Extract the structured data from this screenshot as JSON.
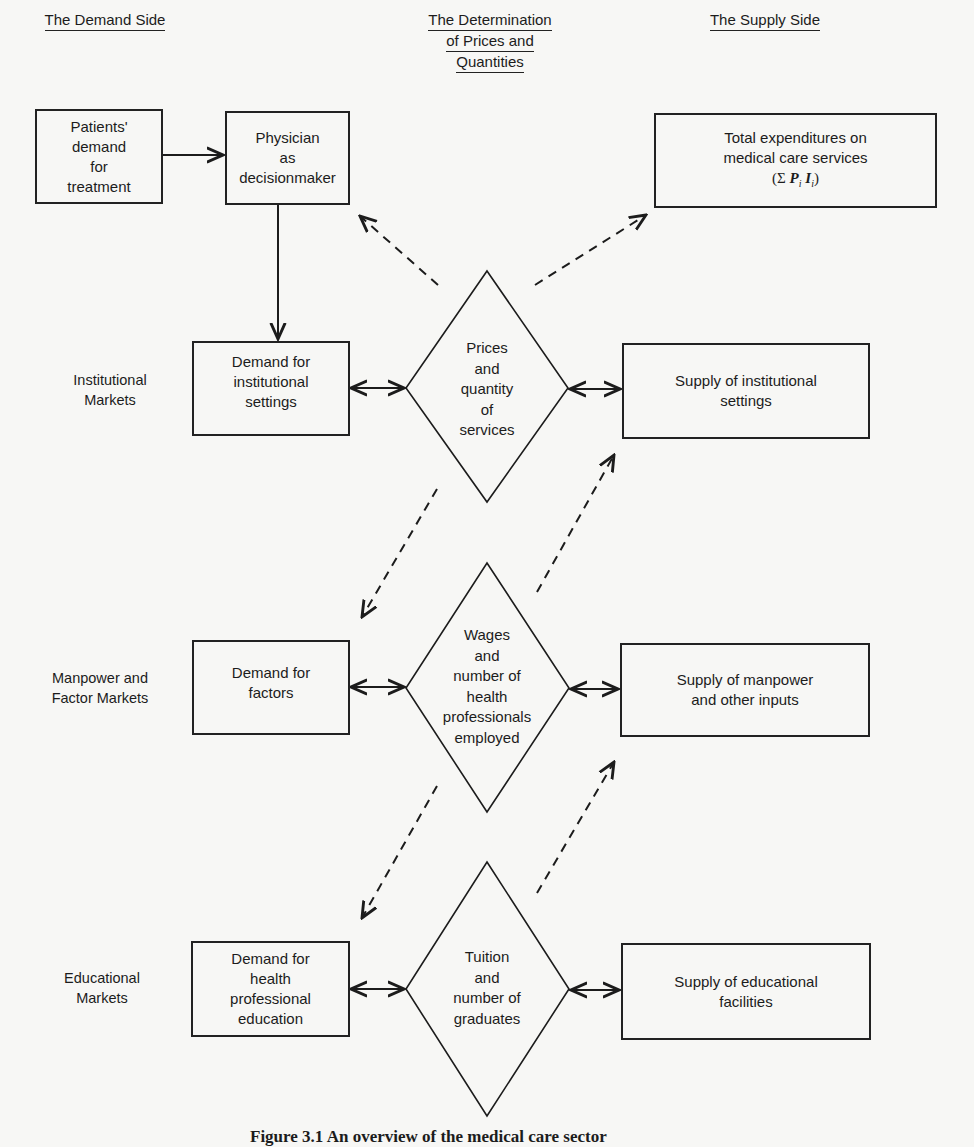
{
  "headers": {
    "demand_side": "The Demand Side",
    "determination": [
      "The Determination",
      "of Prices and",
      "Quantities"
    ],
    "supply_side": "The Supply Side"
  },
  "row_labels": {
    "institutional": [
      "Institutional",
      "Markets"
    ],
    "manpower": [
      "Manpower and",
      "Factor Markets"
    ],
    "educational": [
      "Educational",
      "Markets"
    ]
  },
  "boxes": {
    "patients_demand": [
      "Patients'",
      "demand",
      "for",
      "treatment"
    ],
    "physician": [
      "Physician",
      "as",
      "decisionmaker"
    ],
    "total_expenditures": [
      "Total expenditures on",
      "medical care services"
    ],
    "total_expenditures_formula": {
      "open": "(Σ ",
      "p": "P",
      "p_sub": "i",
      "i": "I",
      "i_sub": "i",
      "close": ")"
    },
    "demand_institutional": [
      "Demand for",
      "institutional",
      "settings"
    ],
    "supply_institutional": [
      "Supply of institutional",
      "settings"
    ],
    "demand_factors": [
      "Demand for",
      "factors"
    ],
    "supply_manpower": [
      "Supply of manpower",
      "and other inputs"
    ],
    "demand_education": [
      "Demand for",
      "health",
      "professional",
      "education"
    ],
    "supply_educational": [
      "Supply of educational",
      "facilities"
    ]
  },
  "diamonds": {
    "prices_quantity": [
      "Prices",
      "and",
      "quantity",
      "of",
      "services"
    ],
    "wages_number": [
      "Wages",
      "and",
      "number of",
      "health",
      "professionals",
      "employed"
    ],
    "tuition_graduates": [
      "Tuition",
      "and",
      "number of",
      "graduates"
    ]
  },
  "caption": "Figure 3.1   An overview of the medical care sector",
  "colors": {
    "ink": "#1c1c1c",
    "paper": "#f7f7f5"
  }
}
